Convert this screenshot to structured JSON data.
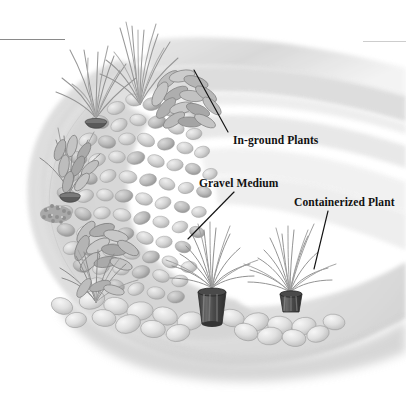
{
  "figure": {
    "medium": "grayscale watercolor illustration",
    "width": 406,
    "height": 396,
    "background_color": "#ffffff"
  },
  "rules": [
    {
      "name": "top-left-rule",
      "x": 0,
      "y": 39,
      "width": 65,
      "tone": "#8a8a8a"
    },
    {
      "name": "top-right-rule",
      "x": 363,
      "y": 41,
      "width": 43,
      "tone": "#cdcdcd"
    }
  ],
  "callouts": [
    {
      "id": "in-ground-plants",
      "label": "In-ground Plants",
      "text_x": 233,
      "text_y": 134,
      "leader": {
        "x1": 228,
        "y1": 132,
        "x2": 194,
        "y2": 70
      }
    },
    {
      "id": "gravel-medium",
      "label": "Gravel Medium",
      "text_x": 199,
      "text_y": 177,
      "leader": {
        "x1": 234,
        "y1": 192,
        "x2": 188,
        "y2": 239
      }
    },
    {
      "id": "containerized-plant",
      "label": "Containerized Plant",
      "text_x": 294,
      "text_y": 196,
      "leader": {
        "x1": 328,
        "y1": 211,
        "x2": 314,
        "y2": 269
      }
    }
  ],
  "scene": {
    "bed_shape": "crescent / kidney-shaped raised bed seen in three-quarter view",
    "ground_tone": "#d8d8d8",
    "gravel_tone": "#dcdcdc",
    "shadow_tone": "#b4b4b4",
    "elements": [
      {
        "name": "background-path-band",
        "description": "pale curved band sweeping from upper-left to right behind the bed"
      },
      {
        "name": "gravel-field",
        "description": "dense field of rounded pebbles filling the bed interior"
      },
      {
        "name": "stone-border",
        "description": "row of large rounded river stones edging the bed front"
      },
      {
        "name": "spiky-grass-clump-upper-left",
        "description": "tall narrow-bladed grass"
      },
      {
        "name": "spiky-grass-clump-upper-mid",
        "description": "tall narrow-bladed grass"
      },
      {
        "name": "broadleaf-clump-upper",
        "description": "broad-leaf foliage rosette"
      },
      {
        "name": "potted-plant-left-upper",
        "description": "container rim visible in gravel"
      },
      {
        "name": "potted-plant-left-lower",
        "description": "container rim visible in gravel"
      },
      {
        "name": "broadleaf-clump-mid-left",
        "description": "broad-leaf foliage rosette"
      },
      {
        "name": "broadleaf-clump-lower-left",
        "description": "broad-leaf foliage rosette"
      },
      {
        "name": "containerized-plant-center",
        "description": "spiky dracaena in a dark tapered nursery pot sitting on the gravel"
      },
      {
        "name": "containerized-plant-right",
        "description": "spiky dracaena in a dark pot partly sunk into the gravel"
      }
    ]
  }
}
